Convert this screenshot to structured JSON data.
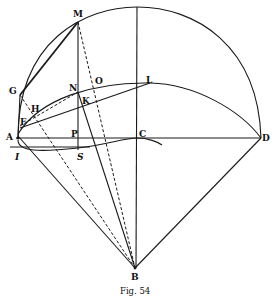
{
  "figure": {
    "caption": "Fig. 54",
    "points": {
      "M": "M",
      "N": "N",
      "O": "O",
      "L": "L",
      "G": "G",
      "H": "H",
      "K": "K",
      "F": "F",
      "A": "A",
      "P": "P",
      "C": "C",
      "D": "D",
      "I": "I",
      "S": "S",
      "B": "B"
    }
  }
}
